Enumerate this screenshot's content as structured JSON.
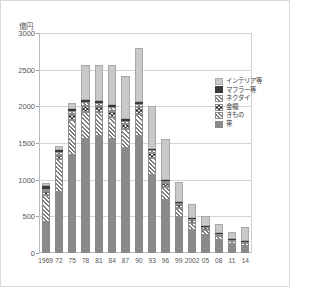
{
  "chart_data": {
    "type": "bar",
    "title": "",
    "subtitle": "",
    "xlabel": "",
    "ylabel": "億円",
    "unit_label": "億円",
    "ylim": [
      0,
      3000
    ],
    "ytick_step": 500,
    "yticks": [
      0,
      500,
      1000,
      1500,
      2000,
      2500,
      3000
    ],
    "ytick_labels": [
      "0",
      "500",
      "1000",
      "1500",
      "2000",
      "2500",
      "3000"
    ],
    "grid": true,
    "stacked": true,
    "legend_position": "right",
    "legend_entries": [
      "インテリア等",
      "マフラー等",
      "ネクタイ",
      "金襴",
      "きもの",
      "帯"
    ],
    "categories": [
      "1969",
      "72",
      "75",
      "78",
      "81",
      "84",
      "87",
      "90",
      "93",
      "96",
      "99",
      "2002",
      "05",
      "08",
      "11",
      "14"
    ],
    "xtick_labels": [
      "1969",
      "72",
      "75",
      "78",
      "81",
      "84",
      "87",
      "90",
      "93",
      "96",
      "99",
      "2002",
      "05",
      "08",
      "11",
      "14"
    ],
    "series": [
      {
        "name": "帯",
        "pattern": "solid-gray",
        "color": "#8a8a8a",
        "values": [
          420,
          830,
          1340,
          1560,
          1590,
          1560,
          1430,
          1600,
          1060,
          720,
          490,
          320,
          250,
          180,
          120,
          95
        ]
      },
      {
        "name": "きもの",
        "pattern": "diagonal-hatch",
        "color": "#7d7d7d",
        "values": [
          370,
          450,
          480,
          360,
          330,
          300,
          260,
          300,
          230,
          180,
          130,
          95,
          70,
          55,
          40,
          35
        ]
      },
      {
        "name": "金襴",
        "pattern": "checkered",
        "color": "#6f6f6f",
        "values": [
          55,
          60,
          75,
          90,
          85,
          80,
          75,
          90,
          70,
          55,
          45,
          35,
          30,
          25,
          20,
          18
        ]
      },
      {
        "name": "ネクタイ",
        "pattern": "diagonal-hatch",
        "color": "#7d7d7d",
        "values": [
          30,
          35,
          40,
          45,
          45,
          45,
          40,
          45,
          40,
          30,
          25,
          20,
          15,
          12,
          10,
          8
        ]
      },
      {
        "name": "マフラー等",
        "pattern": "solid-dark",
        "color": "#3a3a3a",
        "values": [
          45,
          25,
          25,
          30,
          25,
          30,
          25,
          25,
          20,
          15,
          12,
          10,
          8,
          6,
          5,
          4
        ]
      },
      {
        "name": "インテリア等",
        "pattern": "solid-light",
        "color": "#c9c9c9",
        "values": [
          30,
          60,
          90,
          485,
          495,
          555,
          580,
          740,
          580,
          555,
          268,
          190,
          127,
          122,
          85,
          190
        ]
      }
    ],
    "totals": [
      950,
      1460,
      2050,
      2570,
      2570,
      2570,
      2410,
      2800,
      2000,
      1555,
      970,
      670,
      500,
      400,
      280,
      350
    ]
  }
}
